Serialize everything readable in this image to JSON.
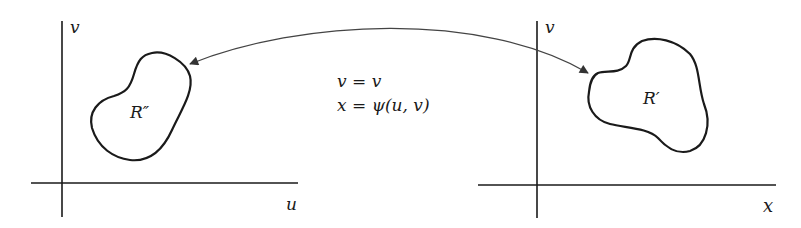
{
  "left_plane": {
    "vertical_axis_label": "v",
    "horizontal_axis_label": "u",
    "region_label": "R″"
  },
  "right_plane": {
    "vertical_axis_label": "v",
    "horizontal_axis_label": "x",
    "region_label": "R′"
  },
  "mapping": {
    "equation_1": "v = v",
    "equation_2": "x = ψ(u, v)"
  },
  "colors": {
    "ink": "#1a1a1a",
    "arrow": "#444444",
    "background": "#ffffff"
  }
}
